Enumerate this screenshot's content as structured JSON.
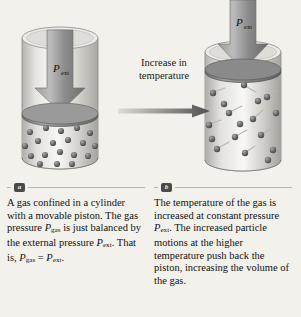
{
  "figure": {
    "transition_label_line1": "Increase in",
    "transition_label_line2": "temperature",
    "arrow_name": "increase-in-temperature-arrow",
    "panel_a": {
      "pressure_label": "P",
      "pressure_subscript": "ext",
      "particle_count": 19,
      "state": "compressed-low-temperature"
    },
    "panel_b": {
      "pressure_label": "P",
      "pressure_subscript": "ext",
      "particle_count": 17,
      "state": "expanded-high-temperature"
    }
  },
  "captions": [
    {
      "badge": "a",
      "lines": [
        "A gas confined in a",
        "cylinder with a movable",
        "piston. The gas pressure",
        "P_gas is just balanced by",
        "the external pressure P_ext.",
        "That is, P_gas = P_ext."
      ],
      "text_plain": "A gas confined in a cylinder with a movable piston. The gas pressure Pgas is just balanced by the external pressure Pext. That is, Pgas = Pext."
    },
    {
      "badge": "b",
      "lines": [
        "The temperature of the",
        "gas is increased at",
        "constant pressure P_ext.",
        "The increased particle",
        "motions at the higher",
        "temperature push back",
        "the piston, increasing the",
        "volume of the gas."
      ],
      "text_plain": "The temperature of the gas is increased at constant pressure Pext. The increased particle motions at the higher temperature push back the piston, increasing the volume of the gas."
    }
  ],
  "colors": {
    "background": "#f3f1ec",
    "rule": "#b9b5ad",
    "badge_bg": "#4a4a4a",
    "text": "#111111",
    "cylinder_glass": "#d9d7d2",
    "piston": "#8d8d8d",
    "arrow": "#909090",
    "particle": "#5a5a5a"
  }
}
